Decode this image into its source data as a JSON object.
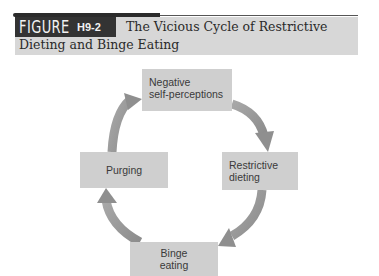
{
  "figure": {
    "label_word": "FIGURE",
    "label_number": "H9-2",
    "title_line1": "The Vicious Cycle of Restrictive",
    "title_line2": "Dieting and Binge Eating"
  },
  "diagram": {
    "type": "cycle",
    "nodes": [
      {
        "id": "top",
        "lines": [
          "Negative",
          "self-perceptions"
        ]
      },
      {
        "id": "right",
        "lines": [
          "Restrictive",
          "dieting"
        ]
      },
      {
        "id": "bottom",
        "lines": [
          "Binge",
          "eating"
        ]
      },
      {
        "id": "left",
        "lines": [
          "Purging"
        ]
      }
    ],
    "edges": [
      {
        "from": "Negative self-perceptions",
        "to": "Restrictive dieting"
      },
      {
        "from": "Restrictive dieting",
        "to": "Binge eating"
      },
      {
        "from": "Binge eating",
        "to": "Purging"
      },
      {
        "from": "Purging",
        "to": "Negative self-perceptions"
      }
    ],
    "colors": {
      "node_fill": "#cfcfcf",
      "arrow_fill": "#9a9a9a",
      "label_box": "#333333",
      "title_band": "#d7d7d7"
    }
  }
}
